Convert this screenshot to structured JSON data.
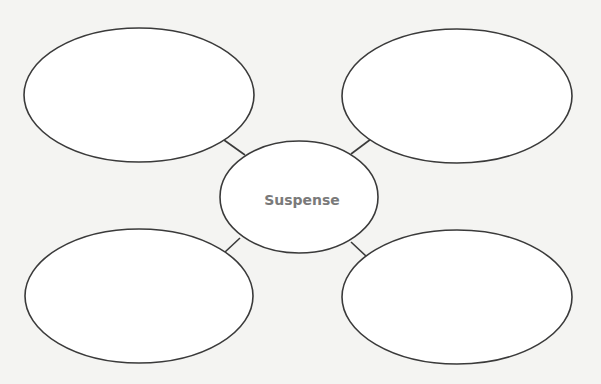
{
  "diagram": {
    "type": "web-organizer",
    "center": {
      "label": "Suspense",
      "cx": 299,
      "cy": 197,
      "rx": 79,
      "ry": 56
    },
    "bubbles": [
      {
        "position": "top-left",
        "label": "",
        "cx": 139,
        "cy": 95,
        "rx": 115,
        "ry": 67
      },
      {
        "position": "top-right",
        "label": "",
        "cx": 457,
        "cy": 96,
        "rx": 115,
        "ry": 67
      },
      {
        "position": "bottom-left",
        "label": "",
        "cx": 139,
        "cy": 296,
        "rx": 114,
        "ry": 67
      },
      {
        "position": "bottom-right",
        "label": "",
        "cx": 457,
        "cy": 297,
        "rx": 115,
        "ry": 67
      }
    ],
    "connectors": [
      {
        "from": "top-left",
        "x1": 224,
        "y1": 140,
        "x2": 245,
        "y2": 155
      },
      {
        "from": "top-right",
        "x1": 371,
        "y1": 139,
        "x2": 351,
        "y2": 154
      },
      {
        "from": "bottom-left",
        "x1": 225,
        "y1": 252,
        "x2": 240,
        "y2": 238
      },
      {
        "from": "bottom-right",
        "x1": 351,
        "y1": 242,
        "x2": 366,
        "y2": 256
      }
    ],
    "colors": {
      "stroke": "#3a3a3a",
      "label": "#7a7a7a",
      "fill": "#ffffff",
      "background": "#f4f4f2"
    }
  }
}
